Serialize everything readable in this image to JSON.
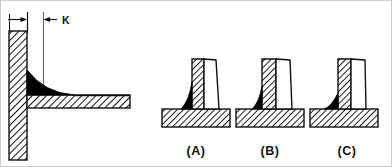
{
  "figure": {
    "background_color": "#ffffff",
    "line_color": "#111111",
    "weld_fill_color": "#000000",
    "border_color": "#c9c9c9",
    "width": 392,
    "height": 167
  },
  "dimension": {
    "label": "K",
    "label_x": 62,
    "label_y": 23,
    "arrow_left_x": 9,
    "arrow_right_x": 27,
    "arrow_y": 19,
    "witness_line_1_x": 27,
    "witness_line_2_x": 43,
    "witness_top_y": 12,
    "witness_bottom_y": 93,
    "second_arrow_tail_x": 57,
    "second_arrow_head_x": 45
  },
  "main_detail": {
    "name": "main-fillet-weld-detail",
    "vertical_plate": {
      "x": 9,
      "y": 31,
      "width": 18,
      "height": 129,
      "hatch": "diagonal"
    },
    "horizontal_plate": {
      "x": 27,
      "y": 95,
      "width": 103,
      "height": 13,
      "hatch": "diagonal"
    },
    "weld_fill": "concave-fillet",
    "weld_color": "#000000"
  },
  "sub_figures": [
    {
      "id": "A",
      "label": "(A)",
      "label_x": 195,
      "label_y": 155,
      "description": "Convex weld profile with unhatched weld metal build-up on right side of vertical member",
      "base_plate": {
        "x": 162,
        "y": 109,
        "width": 68,
        "height": 18
      },
      "vertical_member": {
        "x": 192,
        "y": 60,
        "width": 12,
        "height": 49
      },
      "weld_metal_outline": "unhatched",
      "fillet_color": "#000000"
    },
    {
      "id": "B",
      "label": "(B)",
      "label_x": 268,
      "label_y": 155,
      "description": "Weld profile with hatched left portion of vertical member and unhatched right build-up",
      "base_plate": {
        "x": 236,
        "y": 109,
        "width": 68,
        "height": 18
      },
      "vertical_member": {
        "x": 262,
        "y": 60,
        "width": 14,
        "height": 49
      },
      "weld_metal_outline": "unhatched",
      "fillet_color": "#000000"
    },
    {
      "id": "C",
      "label": "(C)",
      "label_x": 344,
      "label_y": 155,
      "description": "Small black triangular fillet weld at corner junction with unhatched build-up",
      "base_plate": {
        "x": 310,
        "y": 109,
        "width": 68,
        "height": 18
      },
      "vertical_member": {
        "x": 338,
        "y": 60,
        "width": 13,
        "height": 49
      },
      "weld_metal_outline": "unhatched",
      "fillet_color": "#000000"
    }
  ]
}
